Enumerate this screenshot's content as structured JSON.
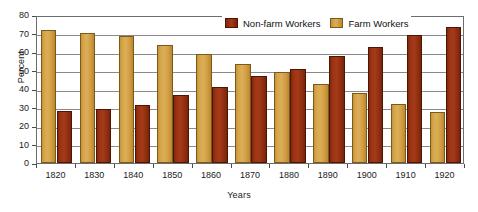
{
  "chart_data": {
    "type": "bar",
    "title": "",
    "subtitle": "",
    "xlabel": "Years",
    "ylabel": "Percent",
    "ylim": [
      0,
      80
    ],
    "ytick_step": 10,
    "yticks": [
      0,
      10,
      20,
      30,
      40,
      50,
      60,
      70,
      80
    ],
    "grid": true,
    "grid_axis": "y",
    "legend_position": "top-right",
    "categories": [
      "1820",
      "1830",
      "1840",
      "1850",
      "1860",
      "1870",
      "1880",
      "1890",
      "1900",
      "1910",
      "1920"
    ],
    "series": [
      {
        "name": "Farm Workers",
        "color": "#d6a64c",
        "values": [
          71.8,
          70.5,
          68.6,
          64.0,
          59.0,
          53.3,
          49.3,
          42.8,
          38.0,
          31.8,
          27.8
        ]
      },
      {
        "name": "Non-farm Workers",
        "color": "#9c3415",
        "values": [
          28.2,
          29.4,
          31.4,
          36.8,
          41.3,
          47.2,
          51.0,
          58.0,
          62.8,
          69.3,
          73.5
        ]
      }
    ],
    "series_draw_order": [
      "Farm Workers",
      "Non-farm Workers"
    ]
  },
  "legend": {
    "entries": [
      {
        "label": "Non-farm Workers",
        "swatch": "nonfarm-swatch"
      },
      {
        "label": "Farm Workers",
        "swatch": "farm-swatch"
      }
    ]
  },
  "axes": {
    "y_title": "Percent",
    "x_title": "Years",
    "y_tick_labels": [
      "80",
      "70",
      "60",
      "50",
      "40",
      "30",
      "20",
      "10",
      "0"
    ],
    "x_tick_labels": [
      "1820",
      "1830",
      "1840",
      "1850",
      "1860",
      "1870",
      "1880",
      "1890",
      "1900",
      "1910",
      "1920"
    ]
  },
  "colors": {
    "farm": "#d6a64c",
    "nonfarm": "#9c3415",
    "axis": "#6d6d6d",
    "gridline": "#8a8a8a",
    "text": "#1a1a1a",
    "background": "#ffffff"
  }
}
